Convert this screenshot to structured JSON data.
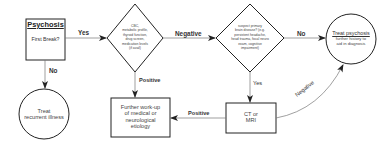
{
  "diagram": {
    "nodes": {
      "start": {
        "shape": "rectangle",
        "title": "Psychosis",
        "question": "First Break?"
      },
      "labs": {
        "shape": "diamond",
        "lines": [
          "CBC,",
          "metabolic profile,",
          "thyroid function,",
          "drug screen,",
          "medication levels",
          "(if avail)"
        ]
      },
      "primary_brain": {
        "shape": "diamond",
        "lines": [
          "suspect primary",
          "brain disease? (e.g.",
          "persistent headache,",
          "head trauma, focal neuro",
          "exam, cognitive",
          "impairment)"
        ]
      },
      "treat_psychosis": {
        "shape": "circle",
        "title": "Treat psychosis",
        "lines": [
          "further history to",
          "aid in diagnosis"
        ]
      },
      "treat_recurrent": {
        "shape": "circle",
        "lines": [
          "Treat",
          "recurrent illness"
        ]
      },
      "further_workup": {
        "shape": "rectangle",
        "lines": [
          "Further work-up",
          "of medical or",
          "neurological",
          "etiology"
        ]
      },
      "ct_mri": {
        "shape": "rectangle",
        "lines": [
          "CT or",
          "MRI"
        ]
      }
    },
    "edges": [
      {
        "from": "start",
        "to": "labs",
        "label": "Yes"
      },
      {
        "from": "start",
        "to": "treat_recurrent",
        "label": "No"
      },
      {
        "from": "labs",
        "to": "primary_brain",
        "label": "Negative"
      },
      {
        "from": "labs",
        "to": "further_workup",
        "label": "Positive"
      },
      {
        "from": "primary_brain",
        "to": "treat_psychosis",
        "label": "No"
      },
      {
        "from": "primary_brain",
        "to": "ct_mri",
        "label": "Yes"
      },
      {
        "from": "ct_mri",
        "to": "further_workup",
        "label": "Positive"
      },
      {
        "from": "ct_mri",
        "to": "treat_psychosis",
        "label": "Negative"
      }
    ],
    "colors": {
      "stroke": "#222222",
      "edge": "#777777",
      "text": "#333333"
    }
  }
}
